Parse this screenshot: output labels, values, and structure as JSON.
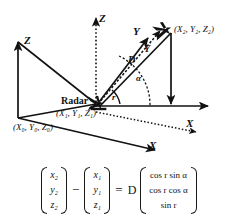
{
  "figure": {
    "kind": "radar-geometry-diagram",
    "axes": {
      "outer_z": "Z",
      "outer_x": "X",
      "inner_z": "Z",
      "inner_y": "Y",
      "inner_x": "X"
    },
    "points": {
      "origin_label": "(X₀, Y₀, Z₀)",
      "radar_label": "Radar",
      "radar_coord": "(X₁, Y₁, Z₁)",
      "target_coord": "(X₂, Y₂, Z₂)"
    },
    "vectors": {
      "slant_range": "D",
      "projection": "Y"
    },
    "angles": {
      "azimuth": "α",
      "elevation": "r"
    }
  },
  "equation": {
    "left_matrix": {
      "rows": [
        "x₂",
        "y₂",
        "z₂"
      ]
    },
    "minus_sign": "−",
    "right_matrix": {
      "rows": [
        "x₁",
        "y₁",
        "z₁"
      ]
    },
    "equals_sign": "=",
    "scalar": "D",
    "result_matrix": {
      "rows": [
        "cos r sin α",
        "cos r cos α",
        "sin r"
      ]
    }
  }
}
